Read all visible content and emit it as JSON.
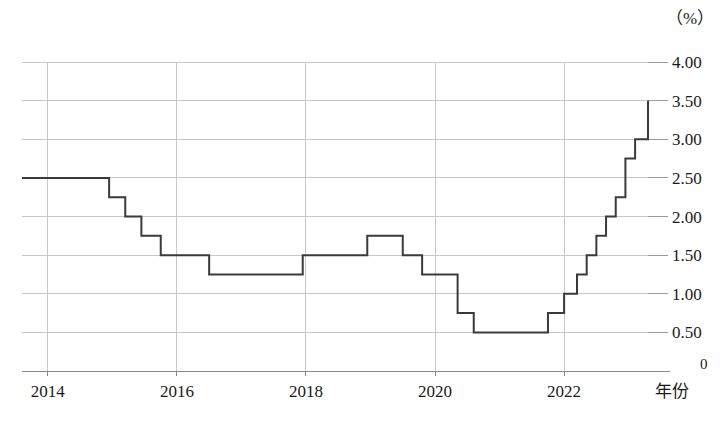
{
  "chart_data": {
    "type": "line",
    "title": "",
    "subtitle": "",
    "xlabel": "年份",
    "ylabel": "",
    "yunit": "（%）",
    "step_style": "post",
    "grid": true,
    "legend": "none",
    "xlim": [
      2013.6,
      2023.3
    ],
    "ylim": [
      0,
      4.0
    ],
    "xticks": [
      "2014",
      "2016",
      "2018",
      "2020",
      "2022"
    ],
    "xtick_values": [
      2014,
      2016,
      2018,
      2020,
      2022
    ],
    "yticks": [
      "0",
      "0.50",
      "1.00",
      "1.50",
      "2.00",
      "2.50",
      "3.00",
      "3.50",
      "4.00"
    ],
    "ytick_values": [
      0,
      0.5,
      1.0,
      1.5,
      2.0,
      2.5,
      3.0,
      3.5,
      4.0
    ],
    "series": [
      {
        "name": "利率",
        "x": [
          2013.6,
          2014.95,
          2015.2,
          2015.45,
          2015.75,
          2016.5,
          2017.95,
          2018.95,
          2019.5,
          2019.8,
          2020.05,
          2020.35,
          2020.6,
          2021.75,
          2022.0,
          2022.2,
          2022.35,
          2022.5,
          2022.65,
          2022.8,
          2022.95,
          2023.1,
          2023.3
        ],
        "values": [
          2.5,
          2.25,
          2.0,
          1.75,
          1.5,
          1.25,
          1.5,
          1.75,
          1.5,
          1.25,
          1.25,
          0.75,
          0.5,
          0.75,
          1.0,
          1.25,
          1.5,
          1.75,
          2.0,
          2.25,
          2.75,
          3.0,
          3.5
        ],
        "color": "#3a3a3a"
      }
    ],
    "annotations": []
  },
  "axes": {
    "y_unit_label": "（%）",
    "x_axis_label": "年份",
    "zero_label": "0"
  },
  "style": {
    "grid_color": "#c8c8c8",
    "line_color": "#3a3a3a",
    "axis_color": "#8a8a8a",
    "text_color": "#1a1a1a",
    "background": "#ffffff"
  }
}
